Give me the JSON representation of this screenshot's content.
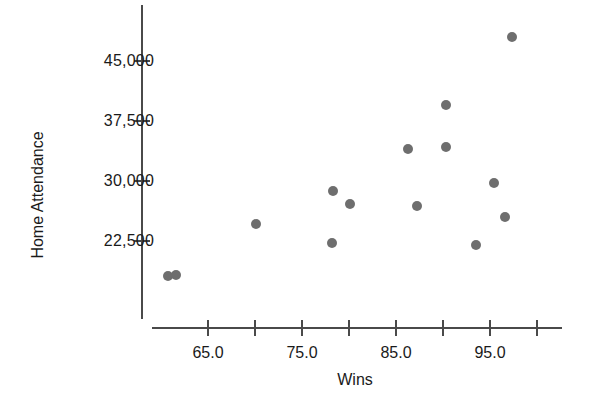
{
  "chart_data": {
    "type": "scatter",
    "title": "",
    "xlabel": "Wins",
    "ylabel": "Home Attendance",
    "xlim": [
      60.0,
      100.5
    ],
    "ylim": [
      15000,
      50500
    ],
    "grid": false,
    "legend": null,
    "marker_color": "#6e6e6e",
    "axis_color": "#4a4a4a",
    "background": "#ffffff",
    "xticks": [
      65.0,
      75.0,
      85.0,
      95.0
    ],
    "xtick_labels": [
      "65.0",
      "75.0",
      "85.0",
      "95.0"
    ],
    "xminor_ticks": [
      70.0,
      80.0,
      90.0,
      100.0
    ],
    "yticks": [
      22500,
      30000,
      37500,
      45000
    ],
    "ytick_labels": [
      "22,500",
      "30,000",
      "37,500",
      "45,000"
    ],
    "points": [
      {
        "x": 60.7,
        "y": 18100
      },
      {
        "x": 61.6,
        "y": 18200
      },
      {
        "x": 70.1,
        "y": 24600
      },
      {
        "x": 78.3,
        "y": 28700
      },
      {
        "x": 78.2,
        "y": 22300
      },
      {
        "x": 80.1,
        "y": 27100
      },
      {
        "x": 86.3,
        "y": 34000
      },
      {
        "x": 87.2,
        "y": 26900
      },
      {
        "x": 90.3,
        "y": 39500
      },
      {
        "x": 90.3,
        "y": 34200
      },
      {
        "x": 93.5,
        "y": 22000
      },
      {
        "x": 95.4,
        "y": 29800
      },
      {
        "x": 96.6,
        "y": 25500
      },
      {
        "x": 97.3,
        "y": 48000
      }
    ]
  }
}
